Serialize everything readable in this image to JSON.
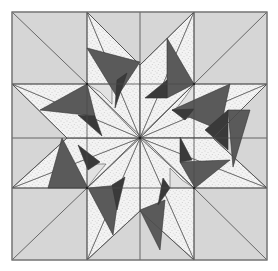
{
  "diagram": {
    "caption": "",
    "colors": {
      "background": "#d6d6d6",
      "speckle": "#f2f2f2",
      "speckle_dot": "#9a9a9a",
      "light_patch": "#e2e2e2",
      "medium_dark": "#5c5c5c",
      "dark": "#3a3a3a",
      "line": "#4a4a4a",
      "border": "#888888"
    },
    "grid": {
      "x": [
        12,
        87,
        140,
        194,
        267
      ],
      "y": [
        12,
        84,
        138,
        188,
        260
      ]
    },
    "center": [
      140,
      138
    ]
  }
}
